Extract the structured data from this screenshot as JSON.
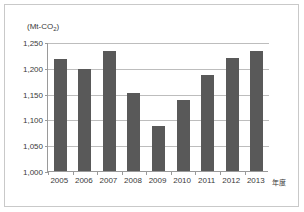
{
  "figure": {
    "unit_label": "(Mt-CO",
    "unit_label_sub": "2",
    "unit_label_close": ")",
    "xaxis_title": "年度",
    "bar_color": "#595959",
    "gridline_color": "#bdbdbd",
    "axis_color": "#9a9a9a",
    "frame_color": "#c9c9c9"
  },
  "chart_data": {
    "type": "bar",
    "title": "",
    "subtitle": "",
    "xlabel": "年度",
    "ylabel": "(Mt-CO2)",
    "categories": [
      "2005",
      "2006",
      "2007",
      "2008",
      "2009",
      "2010",
      "2011",
      "2012",
      "2013"
    ],
    "values": [
      1218,
      1198,
      1233,
      1152,
      1088,
      1137,
      1186,
      1219,
      1232
    ],
    "ylim": [
      1000,
      1250
    ],
    "yticks": [
      1000,
      1050,
      1100,
      1150,
      1200,
      1250
    ],
    "ytick_labels": [
      "1,000",
      "1,050",
      "1,100",
      "1,150",
      "1,200",
      "1,250"
    ],
    "grid": true,
    "legend": false,
    "legend_position": "none"
  }
}
